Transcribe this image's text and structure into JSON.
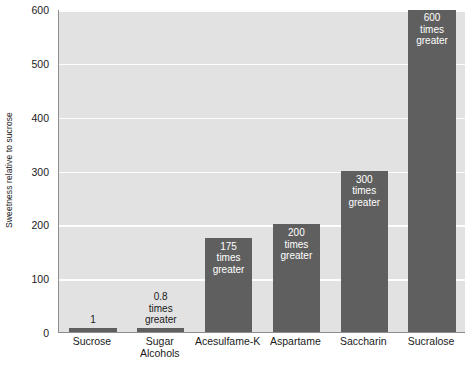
{
  "chart_data": {
    "type": "bar",
    "title": "",
    "xlabel": "",
    "ylabel": "Sweetness relative to sucrose",
    "ylim": [
      0,
      600
    ],
    "yticks": [
      0,
      100,
      200,
      300,
      400,
      500,
      600
    ],
    "ytick_labels": [
      "0",
      "100",
      "200",
      "300",
      "400",
      "500",
      "600"
    ],
    "grid": true,
    "legend": "none",
    "categories": [
      "Sucrose",
      "Sugar Alcohols",
      "Acesulfame-K",
      "Aspartame",
      "Saccharin",
      "Sucralose"
    ],
    "category_label_lines": [
      [
        "Sucrose"
      ],
      [
        "Sugar",
        "Alcohols"
      ],
      [
        "Acesulfame-K"
      ],
      [
        "Aspartame"
      ],
      [
        "Saccharin"
      ],
      [
        "Sucralose"
      ]
    ],
    "values": [
      1,
      0.8,
      175,
      200,
      300,
      600
    ],
    "bar_labels": [
      "1",
      "0.8\ntimes\ngreater",
      "175\ntimes\ngreater",
      "200\ntimes\ngreater",
      "300\ntimes\ngreater",
      "600\ntimes\ngreater"
    ],
    "bar_label_lines": [
      [
        "1"
      ],
      [
        "0.8",
        "times",
        "greater"
      ],
      [
        "175",
        "times",
        "greater"
      ],
      [
        "200",
        "times",
        "greater"
      ],
      [
        "300",
        "times",
        "greater"
      ],
      [
        "600",
        "times",
        "greater"
      ]
    ],
    "bar_label_placement": [
      "above",
      "above",
      "inside",
      "inside",
      "inside",
      "inside"
    ],
    "colors": {
      "bar": "#5f5f5f",
      "plot_background": "#e2e2e2",
      "figure_background": "#ffffff",
      "gridline": "#fdfdfd",
      "axis_line": "#8d8d8d",
      "text": "#1a1a1a",
      "inside_label_text": "#ffffff"
    }
  }
}
